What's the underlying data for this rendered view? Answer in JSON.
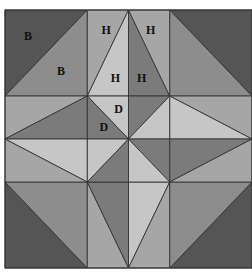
{
  "diagram": {
    "title": "",
    "kind": "quilt-block",
    "grid": {
      "cols": 3,
      "rows": 3
    },
    "bounds_px": {
      "x": 5,
      "y": 10,
      "width": 247,
      "height": 258
    },
    "colors": {
      "dark": "#555555",
      "mediumdark": "#7b7b7b",
      "medium": "#8d8d8d",
      "mediumlight": "#a6a6a6",
      "light": "#c6c6c6",
      "line": "#333333",
      "background": "#ffffff"
    },
    "pieces": [
      {
        "id": "tl-dark",
        "tone": "dark",
        "pts": [
          [
            0,
            0
          ],
          [
            1,
            0
          ],
          [
            0,
            1
          ]
        ],
        "label": "B"
      },
      {
        "id": "tl-med",
        "tone": "medium",
        "pts": [
          [
            1,
            0
          ],
          [
            1,
            1
          ],
          [
            0,
            1
          ]
        ],
        "label": "B"
      },
      {
        "id": "tr-dark",
        "tone": "dark",
        "pts": [
          [
            2,
            0
          ],
          [
            3,
            0
          ],
          [
            3,
            1
          ]
        ],
        "label": ""
      },
      {
        "id": "tr-med",
        "tone": "medium",
        "pts": [
          [
            2,
            0
          ],
          [
            3,
            1
          ],
          [
            2,
            1
          ]
        ],
        "label": ""
      },
      {
        "id": "bl-dark",
        "tone": "dark",
        "pts": [
          [
            0,
            2
          ],
          [
            1,
            3
          ],
          [
            0,
            3
          ]
        ],
        "label": ""
      },
      {
        "id": "bl-med",
        "tone": "medium",
        "pts": [
          [
            0,
            2
          ],
          [
            1,
            2
          ],
          [
            1,
            3
          ]
        ],
        "label": ""
      },
      {
        "id": "br-dark",
        "tone": "dark",
        "pts": [
          [
            3,
            2
          ],
          [
            3,
            3
          ],
          [
            2,
            3
          ]
        ],
        "label": ""
      },
      {
        "id": "br-med",
        "tone": "medium",
        "pts": [
          [
            2,
            2
          ],
          [
            3,
            2
          ],
          [
            2,
            3
          ]
        ],
        "label": ""
      },
      {
        "id": "tm-outer-left",
        "tone": "mediumlight",
        "pts": [
          [
            1,
            0
          ],
          [
            1.5,
            0
          ],
          [
            1,
            1
          ]
        ],
        "label": "H"
      },
      {
        "id": "tm-inner-left",
        "tone": "light",
        "pts": [
          [
            1.5,
            0
          ],
          [
            1.5,
            1
          ],
          [
            1,
            1
          ]
        ],
        "label": "H"
      },
      {
        "id": "tm-inner-right",
        "tone": "mediumdark",
        "pts": [
          [
            1.5,
            0
          ],
          [
            2,
            1
          ],
          [
            1.5,
            1
          ]
        ],
        "label": "H"
      },
      {
        "id": "tm-outer-right",
        "tone": "mediumlight",
        "pts": [
          [
            1.5,
            0
          ],
          [
            2,
            0
          ],
          [
            2,
            1
          ]
        ],
        "label": "H"
      },
      {
        "id": "bm-outer-left",
        "tone": "mediumlight",
        "pts": [
          [
            1,
            2
          ],
          [
            1.5,
            3
          ],
          [
            1,
            3
          ]
        ],
        "label": ""
      },
      {
        "id": "bm-inner-left",
        "tone": "mediumdark",
        "pts": [
          [
            1,
            2
          ],
          [
            1.5,
            2
          ],
          [
            1.5,
            3
          ]
        ],
        "label": ""
      },
      {
        "id": "bm-inner-right",
        "tone": "light",
        "pts": [
          [
            1.5,
            2
          ],
          [
            2,
            2
          ],
          [
            1.5,
            3
          ]
        ],
        "label": ""
      },
      {
        "id": "bm-outer-right",
        "tone": "mediumlight",
        "pts": [
          [
            2,
            2
          ],
          [
            2,
            3
          ],
          [
            1.5,
            3
          ]
        ],
        "label": ""
      },
      {
        "id": "lm-outer-top",
        "tone": "mediumlight",
        "pts": [
          [
            0,
            1
          ],
          [
            1,
            1
          ],
          [
            0,
            1.5
          ]
        ],
        "label": ""
      },
      {
        "id": "lm-inner-top",
        "tone": "mediumdark",
        "pts": [
          [
            0,
            1.5
          ],
          [
            1,
            1
          ],
          [
            1,
            1.5
          ]
        ],
        "label": ""
      },
      {
        "id": "lm-inner-bottom",
        "tone": "light",
        "pts": [
          [
            0,
            1.5
          ],
          [
            1,
            1.5
          ],
          [
            1,
            2
          ]
        ],
        "label": ""
      },
      {
        "id": "lm-outer-bottom",
        "tone": "mediumlight",
        "pts": [
          [
            0,
            1.5
          ],
          [
            1,
            2
          ],
          [
            0,
            2
          ]
        ],
        "label": ""
      },
      {
        "id": "rm-outer-top",
        "tone": "mediumlight",
        "pts": [
          [
            2,
            1
          ],
          [
            3,
            1
          ],
          [
            3,
            1.5
          ]
        ],
        "label": ""
      },
      {
        "id": "rm-inner-top",
        "tone": "light",
        "pts": [
          [
            2,
            1
          ],
          [
            3,
            1.5
          ],
          [
            2,
            1.5
          ]
        ],
        "label": ""
      },
      {
        "id": "rm-inner-bottom",
        "tone": "mediumdark",
        "pts": [
          [
            2,
            1.5
          ],
          [
            3,
            1.5
          ],
          [
            2,
            2
          ]
        ],
        "label": ""
      },
      {
        "id": "rm-outer-bottom",
        "tone": "mediumlight",
        "pts": [
          [
            3,
            1.5
          ],
          [
            3,
            2
          ],
          [
            2,
            2
          ]
        ],
        "label": ""
      },
      {
        "id": "c-tl-top",
        "tone": "light",
        "pts": [
          [
            1,
            1
          ],
          [
            1.5,
            1
          ],
          [
            1.5,
            1.5
          ]
        ],
        "label": "D"
      },
      {
        "id": "c-tl-left",
        "tone": "mediumdark",
        "pts": [
          [
            1,
            1
          ],
          [
            1.5,
            1.5
          ],
          [
            1,
            1.5
          ]
        ],
        "label": "D"
      },
      {
        "id": "c-tr-top",
        "tone": "mediumdark",
        "pts": [
          [
            1.5,
            1
          ],
          [
            2,
            1
          ],
          [
            1.5,
            1.5
          ]
        ],
        "label": ""
      },
      {
        "id": "c-tr-right",
        "tone": "light",
        "pts": [
          [
            2,
            1
          ],
          [
            2,
            1.5
          ],
          [
            1.5,
            1.5
          ]
        ],
        "label": ""
      },
      {
        "id": "c-bl-left",
        "tone": "light",
        "pts": [
          [
            1,
            1.5
          ],
          [
            1.5,
            1.5
          ],
          [
            1,
            2
          ]
        ],
        "label": ""
      },
      {
        "id": "c-bl-bottom",
        "tone": "mediumdark",
        "pts": [
          [
            1.5,
            1.5
          ],
          [
            1.5,
            2
          ],
          [
            1,
            2
          ]
        ],
        "label": ""
      },
      {
        "id": "c-br-right",
        "tone": "mediumdark",
        "pts": [
          [
            1.5,
            1.5
          ],
          [
            2,
            1.5
          ],
          [
            2,
            2
          ]
        ],
        "label": ""
      },
      {
        "id": "c-br-bottom",
        "tone": "light",
        "pts": [
          [
            1.5,
            1.5
          ],
          [
            2,
            2
          ],
          [
            1.5,
            2
          ]
        ],
        "label": ""
      }
    ],
    "labels": [
      {
        "text": "B",
        "at": [
          0.28,
          0.32
        ]
      },
      {
        "text": "B",
        "at": [
          0.68,
          0.72
        ]
      },
      {
        "text": "H",
        "at": [
          1.23,
          0.25
        ]
      },
      {
        "text": "H",
        "at": [
          1.34,
          0.8
        ]
      },
      {
        "text": "H",
        "at": [
          1.66,
          0.8
        ]
      },
      {
        "text": "H",
        "at": [
          1.77,
          0.25
        ]
      },
      {
        "text": "D",
        "at": [
          1.38,
          1.16
        ]
      },
      {
        "text": "D",
        "at": [
          1.2,
          1.38
        ]
      }
    ]
  }
}
